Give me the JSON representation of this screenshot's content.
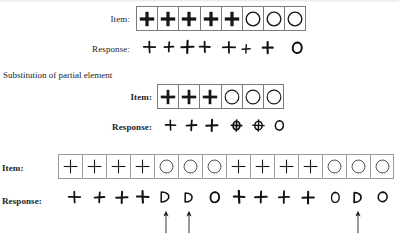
{
  "figure": {
    "sections": [
      {
        "id": "section-1",
        "heading": "",
        "item_label": "Item:",
        "response_label": "Response:",
        "item_bold_labels": false,
        "item_symbols": [
          "plus",
          "plus",
          "plus",
          "plus",
          "plus",
          "circle",
          "circle",
          "circle"
        ],
        "response_symbols": [
          "plus",
          "plus",
          "plus",
          "plus",
          "plus",
          "plus",
          "plus",
          "circle"
        ],
        "response_count": 8,
        "item_count": 8
      },
      {
        "id": "section-2",
        "heading": "Substitution of partial element",
        "item_label": "Item:",
        "response_label": "Response:",
        "item_bold_labels": true,
        "item_symbols": [
          "plus",
          "plus",
          "plus",
          "circle",
          "circle",
          "circle"
        ],
        "response_symbols": [
          "plus",
          "plus",
          "plus",
          "circle-plus",
          "circle-plus",
          "circle"
        ],
        "response_count": 6,
        "item_count": 6
      },
      {
        "id": "section-3",
        "heading": "",
        "item_label": "Item:",
        "response_label": "Response:",
        "item_bold_labels": true,
        "item_symbols": [
          "plus",
          "plus",
          "plus",
          "plus",
          "circle",
          "circle",
          "circle",
          "plus",
          "plus",
          "plus",
          "plus",
          "circle",
          "circle",
          "circle"
        ],
        "response_symbols": [
          "plus",
          "plus",
          "plus",
          "plus",
          "d-shape",
          "d-shape",
          "circle",
          "plus",
          "plus",
          "plus",
          "plus",
          "circle",
          "d-shape",
          "circle"
        ],
        "response_count": 14,
        "item_count": 14,
        "arrow_markers": [
          4,
          5,
          12
        ],
        "arrow_count": 3
      }
    ],
    "legend": {
      "plus_name": "plus-symbol",
      "circle_name": "circle-symbol",
      "circle_plus_name": "circle-with-plus-symbol",
      "d_shape_name": "d-shaped-circle-symbol",
      "arrow_name": "up-arrow-marker"
    },
    "colors": {
      "ink": "#1a1a1a",
      "grid_line": "#7b7b7b",
      "grid_line_light": "#9c9c9c",
      "background": "#ffffff"
    }
  }
}
